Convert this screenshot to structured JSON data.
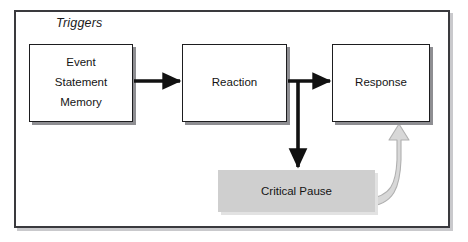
{
  "diagram": {
    "frame": {
      "title": "Triggers"
    },
    "nodes": [
      {
        "id": "triggers-source",
        "lines": [
          "Event",
          "Statement",
          "Memory"
        ],
        "style": "white-box"
      },
      {
        "id": "reaction",
        "label": "Reaction",
        "style": "white-box"
      },
      {
        "id": "response",
        "label": "Response",
        "style": "white-box"
      },
      {
        "id": "critical-pause",
        "label": "Critical Pause",
        "style": "shaded-box"
      }
    ],
    "connectors": [
      {
        "id": "source-to-reaction",
        "from": "triggers-source",
        "to": "reaction",
        "style": "solid-black-arrow"
      },
      {
        "id": "reaction-to-response",
        "from": "reaction",
        "to": "response",
        "style": "solid-black-arrow"
      },
      {
        "id": "reaction-to-pause",
        "from": "reaction",
        "to": "critical-pause",
        "style": "solid-black-arrow"
      },
      {
        "id": "pause-to-response-return",
        "from": "critical-pause",
        "to": "response",
        "style": "gray-curved-block-arrow"
      }
    ],
    "colors": {
      "frame_border": "#3a3a3e",
      "node_border": "#1d1d1f",
      "node_fill": "#ffffff",
      "shaded_fill": "#cfcfcf",
      "arrow_black": "#111111",
      "arrow_gray_fill": "#d8d8d8",
      "arrow_gray_stroke": "#b4b4b4",
      "text": "#141414",
      "background": "#ffffff"
    }
  }
}
